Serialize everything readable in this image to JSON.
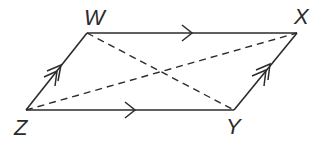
{
  "figure": {
    "type": "parallelogram",
    "vertices": {
      "W": {
        "label": "W",
        "x": 87,
        "y": 33
      },
      "X": {
        "label": "X",
        "x": 297,
        "y": 33
      },
      "Y": {
        "label": "Y",
        "x": 234,
        "y": 110
      },
      "Z": {
        "label": "Z",
        "x": 26,
        "y": 110
      }
    },
    "sides": [
      {
        "name": "WX",
        "style": "solid",
        "parallel_mark": "single-arrow"
      },
      {
        "name": "ZY",
        "style": "solid",
        "parallel_mark": "single-arrow"
      },
      {
        "name": "ZW",
        "style": "solid",
        "parallel_mark": "double-arrow"
      },
      {
        "name": "YX",
        "style": "solid",
        "parallel_mark": "double-arrow"
      }
    ],
    "diagonals": [
      {
        "name": "WY",
        "style": "dashed"
      },
      {
        "name": "ZX",
        "style": "dashed"
      }
    ],
    "colors": {
      "stroke": "#2b2b2b",
      "background": "#ffffff"
    }
  }
}
